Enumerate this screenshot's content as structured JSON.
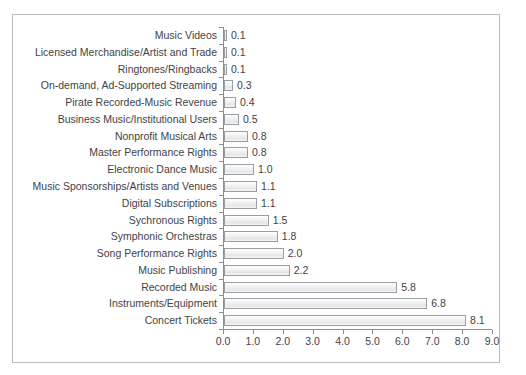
{
  "figure": {
    "background_color": "#ffffff",
    "frame_color": "#b9bcc0",
    "axis_color": "#8a8d91",
    "bar_fill_color": "#eff0f1",
    "bar_border_color": "#9a9da1",
    "text_color": "#3f4246"
  },
  "chart_data": {
    "type": "bar",
    "orientation": "horizontal",
    "title": "",
    "subtitle": "",
    "xlabel": "",
    "ylabel": "",
    "xlim": [
      0.0,
      9.0
    ],
    "xticks": [
      "0.0",
      "1.0",
      "2.0",
      "3.0",
      "4.0",
      "5.0",
      "6.0",
      "7.0",
      "8.0",
      "9.0"
    ],
    "xtick_values": [
      0,
      1,
      2,
      3,
      4,
      5,
      6,
      7,
      8,
      9
    ],
    "grid": false,
    "legend": null,
    "data_labels": true,
    "categories": [
      "Music Videos",
      "Licensed Merchandise/Artist and Trade",
      "Ringtones/Ringbacks",
      "On-demand, Ad-Supported Streaming",
      "Pirate Recorded-Music Revenue",
      "Business Music/Institutional Users",
      "Nonprofit Musical Arts",
      "Master Performance Rights",
      "Electronic Dance Music",
      "Music Sponsorships/Artists and Venues",
      "Digital Subscriptions",
      "Sychronous Rights",
      "Symphonic Orchestras",
      "Song Performance Rights",
      "Music Publishing",
      "Recorded Music",
      "Instruments/Equipment",
      "Concert Tickets"
    ],
    "values": [
      0.1,
      0.1,
      0.1,
      0.3,
      0.4,
      0.5,
      0.8,
      0.8,
      1.0,
      1.1,
      1.1,
      1.5,
      1.8,
      2.0,
      2.2,
      5.8,
      6.8,
      8.1
    ],
    "value_labels": [
      "0.1",
      "0.1",
      "0.1",
      "0.3",
      "0.4",
      "0.5",
      "0.8",
      "0.8",
      "1.0",
      "1.1",
      "1.1",
      "1.5",
      "1.8",
      "2.0",
      "2.2",
      "5.8",
      "6.8",
      "8.1"
    ]
  }
}
